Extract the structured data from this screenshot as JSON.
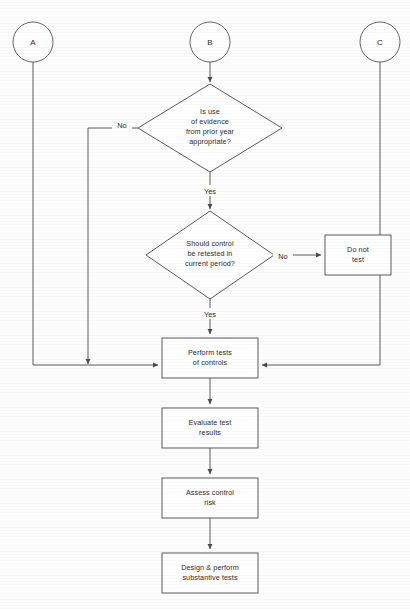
{
  "diagram": {
    "type": "flowchart",
    "title": "",
    "connectors": [
      {
        "id": "conn-a",
        "label": "A",
        "cx": 33,
        "cy": 42,
        "r": 20
      },
      {
        "id": "conn-b",
        "label": "B",
        "cx": 210,
        "cy": 42,
        "r": 20
      },
      {
        "id": "conn-c",
        "label": "C",
        "cx": 380,
        "cy": 42,
        "r": 20
      }
    ],
    "decisions": [
      {
        "id": "decision-prior-year-evidence",
        "lines": [
          "Is use",
          "of evidence",
          "from prior year",
          "appropriate?"
        ],
        "cx": 210,
        "cy": 128,
        "hw": 72,
        "hh": 44
      },
      {
        "id": "decision-retest-control",
        "lines": [
          "Should control",
          "be retested in",
          "current period?"
        ],
        "cx": 210,
        "cy": 255,
        "hw": 64,
        "hh": 44
      }
    ],
    "processes": [
      {
        "id": "process-do-not-test",
        "lines": [
          "Do not",
          "test"
        ],
        "x": 325,
        "y": 235,
        "w": 66,
        "h": 40
      },
      {
        "id": "process-perform-tests-of-controls",
        "lines": [
          "Perform tests",
          "of controls"
        ],
        "x": 162,
        "y": 338,
        "w": 96,
        "h": 40
      },
      {
        "id": "process-evaluate-test-results",
        "lines": [
          "Evaluate test",
          "results"
        ],
        "x": 162,
        "y": 408,
        "w": 96,
        "h": 40
      },
      {
        "id": "process-assess-control-risk",
        "lines": [
          "Assess control",
          "risk"
        ],
        "x": 162,
        "y": 478,
        "w": 96,
        "h": 40
      },
      {
        "id": "process-design-substantive-tests",
        "lines": [
          "Design & perform",
          "substantive tests"
        ],
        "x": 162,
        "y": 553,
        "w": 96,
        "h": 40
      }
    ],
    "edge_labels": [
      {
        "id": "label-no-prior-year",
        "text": "No",
        "x": 122,
        "y": 125
      },
      {
        "id": "label-yes-prior-year",
        "text": "Yes",
        "x": 210,
        "y": 192
      },
      {
        "id": "label-no-retest",
        "text": "No",
        "x": 283,
        "y": 257
      },
      {
        "id": "label-yes-retest",
        "text": "Yes",
        "x": 210,
        "y": 315
      }
    ],
    "colors": {
      "background": "#fdfdfd",
      "stroke": "#4a4a4a",
      "shape_fill": "#ffffff",
      "text": "#2b2b2b"
    }
  }
}
